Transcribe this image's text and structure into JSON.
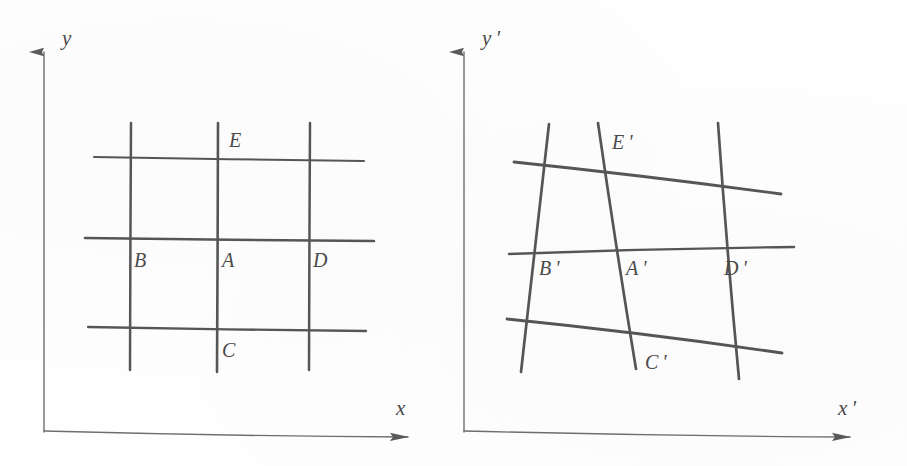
{
  "figure": {
    "kind": "hand-drawn-diagram",
    "caption_text": "",
    "ink_color": "#555555",
    "ink_color_dark": "#4a4a4a",
    "axis_color": "#6b6b6b",
    "background_color": "#fefefe"
  },
  "panels": [
    {
      "id": "reference-configuration",
      "axes": {
        "x_label": "x",
        "y_label": "y",
        "origin": {
          "x": 44,
          "y": 432
        },
        "x_tip": {
          "x": 420,
          "y": 437
        },
        "y_tip": {
          "x": 44,
          "y": 38
        }
      },
      "grid": {
        "type": "undeformed",
        "vertical_lines": [
          {
            "name": "line-B",
            "x_top": 131,
            "y_top": 123,
            "x_bottom": 130,
            "y_bottom": 370
          },
          {
            "name": "line-A",
            "x_top": 218,
            "y_top": 123,
            "x_bottom": 217,
            "y_bottom": 372
          },
          {
            "name": "line-D",
            "x_top": 310,
            "y_top": 123,
            "x_bottom": 309,
            "y_bottom": 370
          }
        ],
        "horizontal_lines": [
          {
            "name": "line-top",
            "x_left": 94,
            "y_left": 157,
            "x_right": 364,
            "y_right": 161
          },
          {
            "name": "line-middle",
            "x_left": 85,
            "y_left": 238,
            "x_right": 374,
            "y_right": 241
          },
          {
            "name": "line-bottom",
            "x_left": 88,
            "y_left": 327,
            "x_right": 366,
            "y_right": 331
          }
        ]
      },
      "node_labels": [
        {
          "name": "node-E",
          "text": "E",
          "x": 229,
          "y": 130
        },
        {
          "name": "node-B",
          "text": "B",
          "x": 134,
          "y": 250
        },
        {
          "name": "node-A",
          "text": "A",
          "x": 222,
          "y": 250
        },
        {
          "name": "node-D",
          "text": "D",
          "x": 313,
          "y": 250
        },
        {
          "name": "node-C",
          "text": "C",
          "x": 222,
          "y": 340
        }
      ]
    },
    {
      "id": "deformed-configuration",
      "axes": {
        "x_label": "x '",
        "y_label": "y '",
        "origin": {
          "x": 464,
          "y": 432
        },
        "x_tip": {
          "x": 862,
          "y": 437
        },
        "y_tip": {
          "x": 464,
          "y": 38
        }
      },
      "grid": {
        "type": "deformed",
        "vertical_lines": [
          {
            "name": "line-B-prime",
            "x_top": 549,
            "y_top": 124,
            "x_bottom": 521,
            "y_bottom": 372
          },
          {
            "name": "line-A-prime",
            "x_top": 598,
            "y_top": 123,
            "x_bottom": 636,
            "y_bottom": 369
          },
          {
            "name": "line-D-prime",
            "x_top": 718,
            "y_top": 123,
            "x_bottom": 739,
            "y_bottom": 379
          }
        ],
        "horizontal_lines": [
          {
            "name": "line-top-prime",
            "x_left": 514,
            "y_left": 162,
            "x_right": 781,
            "y_right": 194
          },
          {
            "name": "line-middle-prime",
            "x_left": 509,
            "y_left": 254,
            "x_right": 794,
            "y_right": 247
          },
          {
            "name": "line-bottom-prime",
            "x_left": 507,
            "y_left": 319,
            "x_right": 782,
            "y_right": 353
          }
        ]
      },
      "node_labels": [
        {
          "name": "node-E-prime",
          "text": "E '",
          "x": 612,
          "y": 132
        },
        {
          "name": "node-B-prime",
          "text": "B '",
          "x": 539,
          "y": 258
        },
        {
          "name": "node-A-prime",
          "text": "A '",
          "x": 626,
          "y": 258
        },
        {
          "name": "node-D-prime",
          "text": "D '",
          "x": 724,
          "y": 258
        },
        {
          "name": "node-C-prime",
          "text": "C '",
          "x": 645,
          "y": 352
        }
      ]
    }
  ],
  "axis_label_positions": {
    "left_y": {
      "x": 62,
      "y": 28
    },
    "left_x": {
      "x": 396,
      "y": 398
    },
    "right_y": {
      "x": 482,
      "y": 28
    },
    "right_x": {
      "x": 838,
      "y": 398
    }
  }
}
